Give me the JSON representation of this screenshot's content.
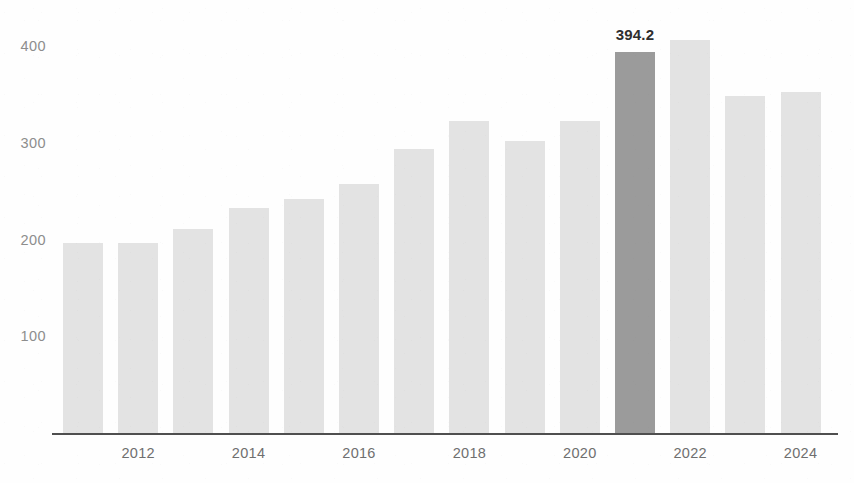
{
  "chart_data": {
    "type": "bar",
    "title": "",
    "subtitle": "",
    "xlabel": "",
    "ylabel": "",
    "categories": [
      "2011",
      "2012",
      "2013",
      "2014",
      "2015",
      "2016",
      "2017",
      "2018",
      "2019",
      "2020",
      "2021",
      "2022",
      "2023",
      "2024"
    ],
    "values": [
      196,
      196,
      211,
      233,
      242,
      257,
      294,
      323,
      302,
      323,
      394.2,
      406,
      349,
      353
    ],
    "ylim": [
      0,
      430
    ],
    "xlim_categories": [
      "2011",
      "2024"
    ],
    "grid": false,
    "legend": null,
    "y_ticks": [
      "400",
      "300",
      "200",
      "100"
    ],
    "y_tick_values": [
      400,
      300,
      200,
      100
    ],
    "x_tick_labels": [
      "2012",
      "2014",
      "2016",
      "2018",
      "2020",
      "2022",
      "2024"
    ],
    "x_tick_categories": [
      "2012",
      "2014",
      "2016",
      "2018",
      "2020",
      "2022",
      "2024"
    ],
    "highlight_category": "2021",
    "highlight_index": 10,
    "data_labels": [
      {
        "category": "2021",
        "text": "394.2",
        "value": 394.2
      }
    ],
    "colors": {
      "bar": "#e3e3e3",
      "bar_highlight": "#9b9b9b",
      "axis": "#4f4f4f",
      "y_tick_text": "#8d8d8d",
      "x_tick_text": "#6f6f6f",
      "data_label_text": "#2e2e2e",
      "background": "#fefefe"
    }
  }
}
